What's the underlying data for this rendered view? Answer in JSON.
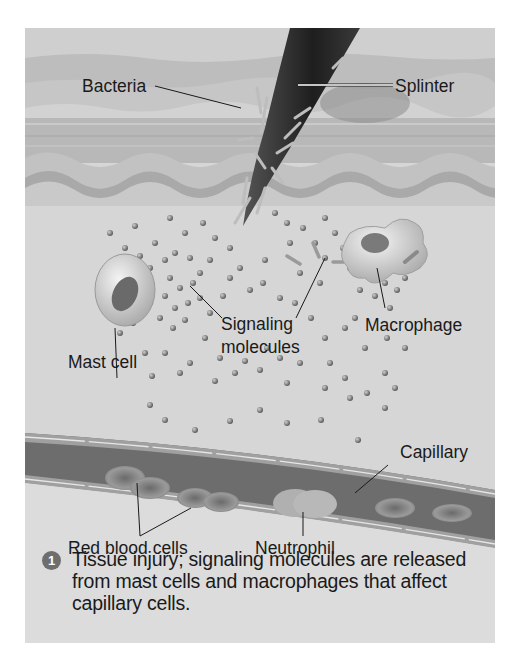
{
  "figure": {
    "labels": {
      "bacteria": "Bacteria",
      "splinter": "Splinter",
      "signaling_line1": "Signaling",
      "signaling_line2": "molecules",
      "macrophage": "Macrophage",
      "mast_cell": "Mast cell",
      "capillary": "Capillary",
      "red_blood_cells": "Red blood cells",
      "neutrophil": "Neutrophil"
    },
    "step": {
      "number": "1",
      "caption": "Tissue injury; signaling molecules are released from mast cells and macrophages that affect capillary cells."
    },
    "colors": {
      "background": "#d6d6d6",
      "skin_light": "#c4c4c4",
      "skin_mid": "#b3b3b3",
      "splinter": "#2b2b2b",
      "vessel": "#8a8a8a",
      "badge": "#6e6e6e"
    }
  }
}
